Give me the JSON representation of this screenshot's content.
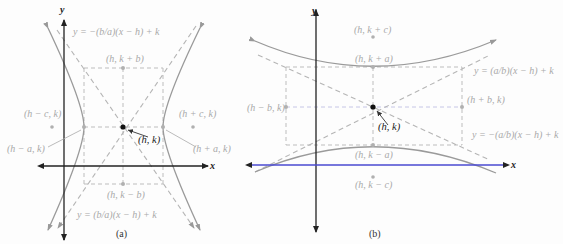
{
  "figure": {
    "panels": [
      {
        "id": "a",
        "caption": "(a)",
        "orientation": "horizontal transverse axis",
        "axes": {
          "x_label": "x",
          "y_label": "y"
        },
        "center_label": "(h, k)",
        "labels": {
          "top_asymptote": "y = −(b/a)(x − h) + k",
          "bottom_asymptote": "y = (b/a)(x − h) + k",
          "co_vertex_top": "(h, k + b)",
          "co_vertex_bottom": "(h, k − b)",
          "focus_left": "(h − c, k)",
          "focus_right": "(h + c, k)",
          "vertex_left": "(h − a, k)",
          "vertex_right": "(h + a, k)"
        }
      },
      {
        "id": "b",
        "caption": "(b)",
        "orientation": "vertical transverse axis",
        "axes": {
          "x_label": "x",
          "y_label": "y"
        },
        "center_label": "(h, k)",
        "labels": {
          "upper_asymptote": "y = (a/b)(x − h) + k",
          "lower_asymptote": "y = −(a/b)(x − h) + k",
          "focus_top": "(h, k + c)",
          "focus_bottom": "(h, k − c)",
          "vertex_top": "(h, k + a)",
          "vertex_bottom": "(h, k − a)",
          "co_vertex_left": "(h − b, k)",
          "co_vertex_right": "(h + b, k)"
        }
      }
    ],
    "colors": {
      "axis": "#222222",
      "x_axis_b": "#4a4ad0",
      "curve": "#9a9a9a",
      "dashed": "#b8b8b8",
      "box_b_horizontal": "#c6c6e6",
      "label": "#a9a9a9",
      "center_point": "#111111"
    }
  }
}
